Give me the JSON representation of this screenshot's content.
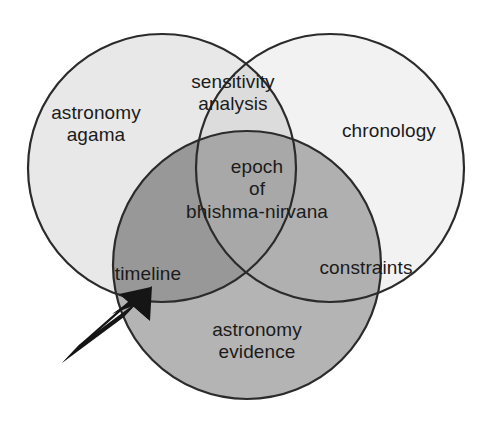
{
  "diagram": {
    "type": "venn-3-circle",
    "title": "",
    "background_color": "#ffffff",
    "stroke_color": "#2b2b2b",
    "text_color": "#1b1b1b",
    "sets": [
      {
        "id": "astronomy-agama",
        "label": "astronomy\nagama",
        "position": "left",
        "fill_color": "#e8e8e8"
      },
      {
        "id": "chronology",
        "label": "chronology",
        "position": "right",
        "fill_color": "#f2f2f2"
      },
      {
        "id": "astronomy-evidence",
        "label": "astronomy\nevidence",
        "position": "bottom",
        "fill_color": "#b4b4b4"
      }
    ],
    "intersections": [
      {
        "id": "sensitivity-analysis",
        "label": "sensitivity\nanalysis",
        "between": [
          "astronomy-agama",
          "chronology"
        ],
        "fill_color": "#dcdcdc"
      },
      {
        "id": "timeline",
        "label": "timeline",
        "between": [
          "astronomy-agama",
          "astronomy-evidence"
        ],
        "fill_color": "#989898"
      },
      {
        "id": "constraints",
        "label": "constraints",
        "between": [
          "chronology",
          "astronomy-evidence"
        ],
        "fill_color": "#b0b0b0"
      },
      {
        "id": "epoch-of-bhishma-nirvana",
        "label": "epoch\nof\nbhishma-nirvana",
        "between": [
          "astronomy-agama",
          "chronology",
          "astronomy-evidence"
        ],
        "fill_color": "#a8a8a8"
      }
    ],
    "annotations": [
      {
        "id": "pointer-arrow",
        "kind": "arrow",
        "color": "#151515",
        "points_to": "timeline",
        "from": [
          68,
          355
        ],
        "to": [
          151,
          288
        ]
      }
    ]
  }
}
